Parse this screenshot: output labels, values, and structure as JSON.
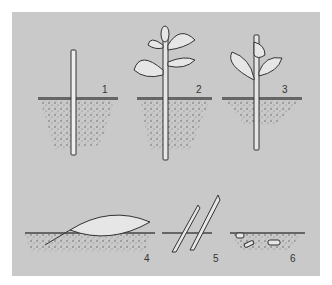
{
  "figure": {
    "labels": [
      {
        "id": "1",
        "text": "1",
        "x": 102,
        "y": 84
      },
      {
        "id": "2",
        "text": "2",
        "x": 196,
        "y": 84
      },
      {
        "id": "3",
        "text": "3",
        "x": 282,
        "y": 84
      },
      {
        "id": "4",
        "text": "4",
        "x": 144,
        "y": 253
      },
      {
        "id": "5",
        "text": "5",
        "x": 213,
        "y": 253
      },
      {
        "id": "6",
        "text": "6",
        "x": 290,
        "y": 253
      }
    ],
    "colors": {
      "background": "#c9c9c9",
      "ink": "#333333",
      "leaf": "#e6e6e6",
      "soil": "#7a7a7a"
    }
  }
}
